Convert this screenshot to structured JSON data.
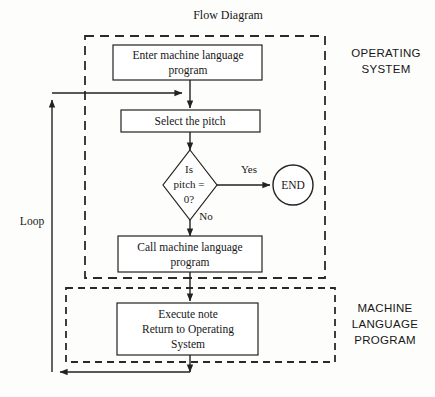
{
  "figure": {
    "title": "Flow Diagram",
    "background_color": "#fdfdfb",
    "line_color": "#222222"
  },
  "regions": [
    {
      "id": "operating-system",
      "label_line1": "OPERATING",
      "label_line2": "SYSTEM",
      "border_style": "dashed"
    },
    {
      "id": "machine-language-program",
      "label_line1": "MACHINE",
      "label_line2": "LANGUAGE",
      "label_line3": "PROGRAM",
      "border_style": "dashed"
    }
  ],
  "nodes": {
    "enter_program": {
      "shape": "process",
      "line1": "Enter machine language",
      "line2": "program"
    },
    "select_pitch": {
      "shape": "process",
      "line1": "Select the pitch"
    },
    "decision_pitch": {
      "shape": "decision",
      "line1": "Is",
      "line2": "pitch =",
      "line3": "0?"
    },
    "end_terminal": {
      "shape": "terminal",
      "line1": "END"
    },
    "call_program": {
      "shape": "process",
      "line1": "Call machine language",
      "line2": "program"
    },
    "execute_note": {
      "shape": "process",
      "line1": "Execute note",
      "line2": "Return to Operating",
      "line3": "System"
    }
  },
  "edge_labels": {
    "yes": "Yes",
    "no": "No",
    "loop": "Loop"
  }
}
